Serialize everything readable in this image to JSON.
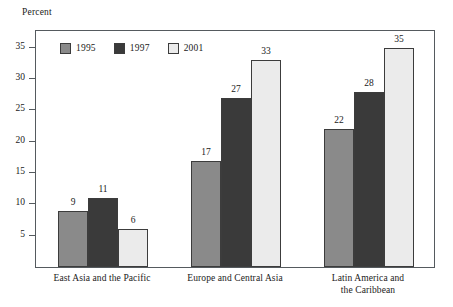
{
  "axis_title": "Percent",
  "legend": {
    "items": [
      {
        "label": "1995",
        "color": "#8a8a8a",
        "swatch_name": "legend-swatch-1995"
      },
      {
        "label": "1997",
        "color": "#3a3a3a",
        "swatch_name": "legend-swatch-1997"
      },
      {
        "label": "2001",
        "color": "#ebebeb",
        "swatch_name": "legend-swatch-2001"
      }
    ]
  },
  "y_axis": {
    "ticks": [
      "5",
      "10",
      "15",
      "20",
      "25",
      "30",
      "35"
    ]
  },
  "categories": [
    "East Asia and the Pacific",
    "Europe and Central Asia",
    "Latin America and\nthe Caribbean"
  ],
  "values": {
    "g0": {
      "s0": "9",
      "s1": "11",
      "s2": "6"
    },
    "g1": {
      "s0": "17",
      "s1": "27",
      "s2": "33"
    },
    "g2": {
      "s0": "22",
      "s1": "28",
      "s2": "35"
    }
  },
  "chart_data": {
    "type": "bar",
    "title": "",
    "subtitle": "",
    "xlabel": "",
    "ylabel": "Percent",
    "categories": [
      "East Asia and the Pacific",
      "Europe and Central Asia",
      "Latin America and the Caribbean"
    ],
    "series": [
      {
        "name": "1995",
        "color": "#8a8a8a",
        "values": [
          9,
          11,
          6
        ]
      },
      {
        "name": "1997",
        "color": "#3a3a3a",
        "values": [
          11,
          27,
          28
        ]
      },
      {
        "name": "2001",
        "color": "#ebebeb",
        "values": [
          6,
          33,
          35
        ]
      }
    ],
    "series_corrected": [
      {
        "name": "1995",
        "values": [
          9,
          17,
          22
        ]
      },
      {
        "name": "1997",
        "values": [
          11,
          27,
          28
        ]
      },
      {
        "name": "2001",
        "values": [
          6,
          33,
          35
        ]
      }
    ],
    "ylim": [
      0,
      38
    ],
    "yticks": [
      5,
      10,
      15,
      20,
      25,
      30,
      35
    ],
    "grid": false,
    "legend_position": "top-left-inside",
    "data_labels": true
  }
}
